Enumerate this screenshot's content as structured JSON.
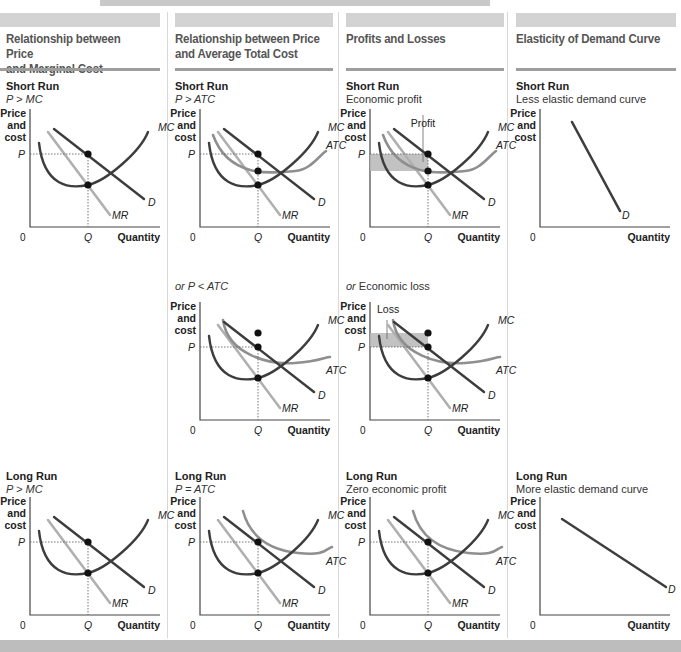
{
  "colors": {
    "dark_curve": "#3d3d3d",
    "light_curve": "#b0b0b0",
    "atc_curve": "#8f8f8f",
    "shade": "#b7b7b7",
    "axis": "#444444",
    "header_band": "#d3d3d3",
    "rule": "#9e9e9e"
  },
  "columns": [
    {
      "title_line1": "Relationship between Price",
      "title_line2": "and Marginal Cost",
      "panels": [
        {
          "run": "Short Run",
          "cond": "P > MC",
          "cond_italic": true
        },
        null,
        {
          "run": "Long Run",
          "cond": "P > MC",
          "cond_italic": true
        }
      ]
    },
    {
      "title_line1": "Relationship between Price",
      "title_line2": "and Average Total Cost",
      "panels": [
        {
          "run": "Short Run",
          "cond": "P > ATC",
          "cond_italic": true
        },
        {
          "run": "",
          "cond_prefix": "or ",
          "cond": "P < ATC",
          "cond_italic": true
        },
        {
          "run": "Long Run",
          "cond": "P = ATC",
          "cond_italic": true
        }
      ]
    },
    {
      "title_line1": "Profits and Losses",
      "title_line2": "",
      "panels": [
        {
          "run": "Short Run",
          "cond": "Economic profit",
          "cond_italic": false
        },
        {
          "run": "",
          "cond_prefix": "or ",
          "cond": "Economic loss",
          "cond_italic": false
        },
        {
          "run": "Long Run",
          "cond": "Zero economic profit",
          "cond_italic": false
        }
      ]
    },
    {
      "title_line1": "Elasticity of Demand Curve",
      "title_line2": "",
      "panels": [
        {
          "run": "Short Run",
          "cond": "Less elastic demand curve",
          "cond_italic": false
        },
        null,
        {
          "run": "Long Run",
          "cond": "More elastic demand curve",
          "cond_italic": false
        }
      ]
    }
  ],
  "axis_labels": {
    "y_line1": "Price",
    "y_line2": "and",
    "y_line3": "cost",
    "x": "Quantity",
    "origin": "0",
    "q": "Q",
    "p": "P"
  },
  "curve_labels": {
    "mc": "MC",
    "atc": "ATC",
    "d": "D",
    "mr": "MR",
    "profit": "Profit",
    "loss": "Loss"
  },
  "chart_data": [
    {
      "type": "line",
      "title": "Short Run P > MC",
      "xlabel": "Quantity",
      "ylabel": "Price and cost",
      "series": [
        "MC",
        "D",
        "MR"
      ],
      "annotations": [
        "P",
        "Q",
        "0"
      ],
      "points": [
        "P on D at Q",
        "MC = MR at Q"
      ]
    },
    {
      "type": "line",
      "title": "Short Run P > ATC",
      "xlabel": "Quantity",
      "ylabel": "Price and cost",
      "series": [
        "MC",
        "ATC",
        "D",
        "MR"
      ],
      "annotations": [
        "P",
        "Q",
        "0"
      ]
    },
    {
      "type": "line",
      "title": "Short Run Economic profit",
      "xlabel": "Quantity",
      "ylabel": "Price and cost",
      "series": [
        "MC",
        "ATC",
        "D",
        "MR"
      ],
      "annotations": [
        "Profit",
        "P",
        "Q",
        "0"
      ]
    },
    {
      "type": "line",
      "title": "Short Run Less elastic demand curve",
      "xlabel": "Quantity",
      "ylabel": "Price and cost",
      "series": [
        "D"
      ]
    },
    {
      "type": "line",
      "title": "or P < ATC",
      "xlabel": "Quantity",
      "ylabel": "Price and cost",
      "series": [
        "MC",
        "ATC",
        "D",
        "MR"
      ],
      "annotations": [
        "P",
        "Q",
        "0"
      ]
    },
    {
      "type": "line",
      "title": "or Economic loss",
      "xlabel": "Quantity",
      "ylabel": "Price and cost",
      "series": [
        "MC",
        "ATC",
        "D",
        "MR"
      ],
      "annotations": [
        "Loss",
        "P",
        "Q",
        "0"
      ]
    },
    {
      "type": "line",
      "title": "Long Run P > MC",
      "xlabel": "Quantity",
      "ylabel": "Price and cost",
      "series": [
        "MC",
        "D",
        "MR"
      ],
      "annotations": [
        "P",
        "Q",
        "0"
      ]
    },
    {
      "type": "line",
      "title": "Long Run P = ATC",
      "xlabel": "Quantity",
      "ylabel": "Price and cost",
      "series": [
        "MC",
        "ATC",
        "D",
        "MR"
      ],
      "annotations": [
        "P",
        "Q",
        "0"
      ]
    },
    {
      "type": "line",
      "title": "Long Run Zero economic profit",
      "xlabel": "Quantity",
      "ylabel": "Price and cost",
      "series": [
        "MC",
        "ATC",
        "D",
        "MR"
      ],
      "annotations": [
        "P",
        "Q",
        "0"
      ]
    },
    {
      "type": "line",
      "title": "Long Run More elastic demand curve",
      "xlabel": "Quantity",
      "ylabel": "Price and cost",
      "series": [
        "D"
      ]
    }
  ]
}
